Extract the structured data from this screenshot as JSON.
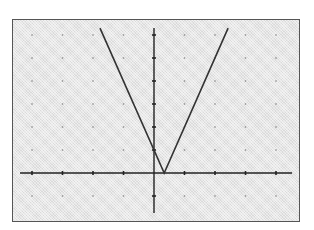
{
  "chart_data": {
    "type": "line",
    "title": "",
    "function": "y = |3x - 1|",
    "xlabel": "",
    "ylabel": "",
    "xlim": [
      -4.2,
      4.5
    ],
    "ylim": [
      -1.7,
      6.3
    ],
    "x_tick_step": 1,
    "y_tick_step": 1,
    "grid": "dots",
    "series": [
      {
        "name": "graph",
        "x": [
          -1.77,
          0.333,
          2.43
        ],
        "y": [
          6.3,
          0,
          6.3
        ]
      }
    ],
    "vertex": [
      0.333,
      0
    ],
    "y_intercept": 1
  },
  "colors": {
    "screen_bg": "#e6e6e6",
    "line": "#333333",
    "axes": "#222222",
    "dots": "#888888",
    "frame": "#555555"
  }
}
